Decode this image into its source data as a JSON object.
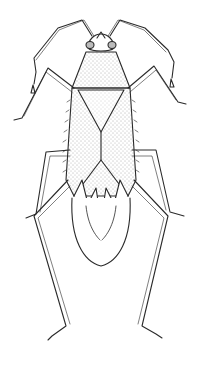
{
  "figure": {
    "caption_fragment": "",
    "colors": {
      "background": "#ffffff",
      "ink": "#2a2a2a",
      "stipple": "#555555"
    }
  }
}
